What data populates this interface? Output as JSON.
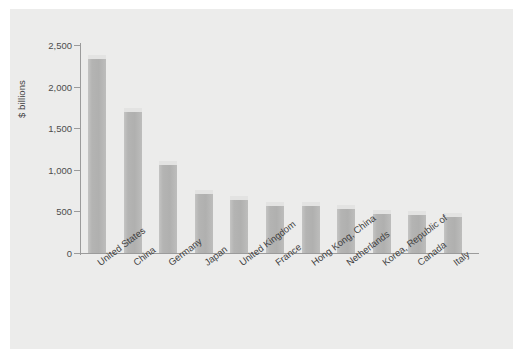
{
  "chart_data": {
    "type": "bar",
    "title": "",
    "subtitle": "",
    "xlabel": "",
    "ylabel": "$ billions",
    "ylim": [
      0,
      2500
    ],
    "yticks": [
      "0",
      "500",
      "1,000",
      "1,500",
      "2,000",
      "2,500"
    ],
    "ytick_values": [
      0,
      500,
      1000,
      1500,
      2000,
      2500
    ],
    "grid": false,
    "legend": null,
    "categories": [
      "United States",
      "China",
      "Germany",
      "Japan",
      "United Kingdom",
      "France",
      "Hong Kong, China",
      "Netherlands",
      "Korea, Republic of",
      "Canada",
      "Italy"
    ],
    "values": [
      2330,
      1700,
      1060,
      710,
      640,
      570,
      560,
      530,
      470,
      455,
      430
    ],
    "bar_color": "#b4b4b3",
    "bar_cap_color": "#e3e3e2",
    "panel_color": "#ececeb",
    "axis_color": "#9b9b9b",
    "text_color": "#3f3f3f"
  }
}
